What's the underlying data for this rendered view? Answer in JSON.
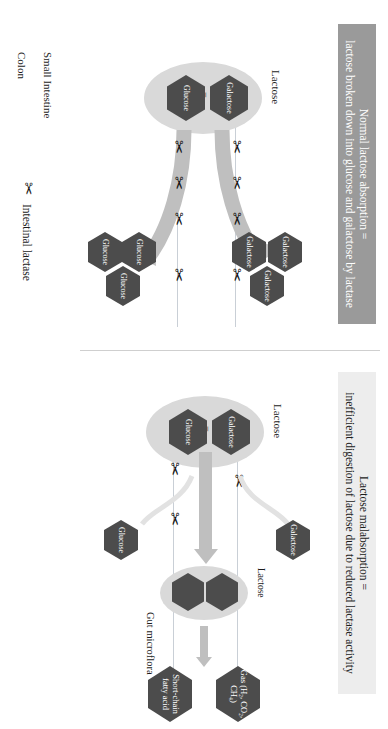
{
  "figure": {
    "title_normal": {
      "line1": "Normal lactose absorption =",
      "line2": "lactose broken down into glucose and galactose by lactase"
    },
    "title_malabsorption": {
      "line1": "Lactose malabsorption =",
      "line2": "inefficient digestion of lactose due to reduced lactase activity"
    },
    "compartments": {
      "small_intestine": "Small Intestine",
      "colon": "Colon"
    },
    "legend": {
      "icon": "scissors-icon",
      "label": "Intestinal lactase"
    },
    "normal_panel": {
      "lactose_label": "Lactose",
      "equals": "=",
      "subunit_glucose": "Glucose",
      "subunit_galactose": "Galactose",
      "products_galactose": [
        "Galactose",
        "Galactose",
        "Galactose"
      ],
      "products_glucose": [
        "Glucose",
        "Glucose",
        "Glucose"
      ],
      "lactase_count_top": 4,
      "lactase_count_bottom": 4
    },
    "malabsorption_panel": {
      "lactose_label": "Lactose",
      "equals": "=",
      "subunit_glucose": "Glucose",
      "subunit_galactose": "Galactose",
      "escaped_galactose": "Galactose",
      "escaped_glucose": "Glucose",
      "undigested_lactose_label": "Lactose",
      "gut_microflora_label": "Gut microflora",
      "product_gas": "Gas (H₂, CO₂, CH₄)",
      "product_scfa": "Short-chain fatty acid",
      "lactase_count_top": 1,
      "lactase_count_bottom": 2
    },
    "colors": {
      "hexagon_fill": "#4c4c4c",
      "oval_fill": "#d9d9d9",
      "arrow_fill": "#bfbfbf",
      "banner_normal_bg": "#9a9a9a",
      "banner_malabsorption_bg": "#ededed",
      "membrane_line": "#c9cfd6",
      "text_dark": "#1c1c1c",
      "text_light": "#ffffff"
    }
  }
}
